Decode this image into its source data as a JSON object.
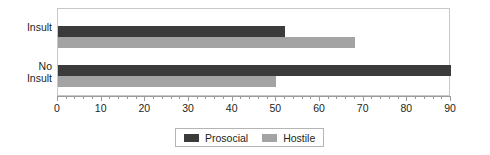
{
  "chart_data": {
    "type": "bar",
    "orientation": "horizontal",
    "title": "",
    "xlabel": "",
    "ylabel": "",
    "categories": [
      "Insult",
      "No Insult"
    ],
    "category_labels_multiline": [
      "Insult",
      "No\nInsult"
    ],
    "series": [
      {
        "name": "Prosocial",
        "color": "#3b3b3b",
        "values": [
          52,
          90
        ]
      },
      {
        "name": "Hostile",
        "color": "#a3a3a3",
        "values": [
          68,
          50
        ]
      }
    ],
    "xlim": [
      0,
      90
    ],
    "xticks": [
      0,
      10,
      20,
      30,
      40,
      50,
      60,
      70,
      80,
      90
    ],
    "xtick_labels": [
      "0",
      "10",
      "20",
      "30",
      "40",
      "50",
      "60",
      "70",
      "80",
      "90"
    ],
    "minor_tick_step": 2,
    "grid": false,
    "legend_position": "bottom-center",
    "legend_entries": [
      "Prosocial",
      "Hostile"
    ]
  },
  "legend": {
    "entries": [
      {
        "label": "Prosocial"
      },
      {
        "label": "Hostile"
      }
    ]
  },
  "colors": {
    "prosocial": "#3b3b3b",
    "hostile": "#a3a3a3",
    "axis": "#9a9a9a",
    "frame": "#c8c8c8",
    "text": "#231f20",
    "background": "#ffffff"
  }
}
